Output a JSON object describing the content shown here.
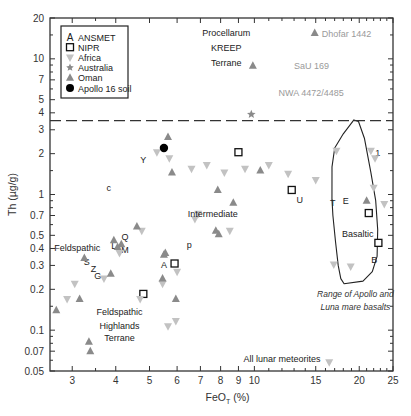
{
  "chart_data": {
    "type": "scatter",
    "title": "",
    "xlabel": "FeO_T (%)",
    "xlabel_main": "FeO",
    "xlabel_sub": "T",
    "xlabel_tail": " (%)",
    "ylabel": "Th (µg/g)",
    "xscale": "log",
    "yscale": "log",
    "xlim": [
      2.59,
      25
    ],
    "ylim": [
      0.05,
      20
    ],
    "x_ticks": [
      3,
      4,
      5,
      6,
      7,
      8,
      9,
      10,
      15,
      20,
      25
    ],
    "x_minor_ticks": [
      3.5,
      11,
      12,
      13,
      14,
      16,
      17,
      18,
      19,
      21,
      22,
      23,
      24
    ],
    "y_ticks": [
      {
        "value": 0.05,
        "label": "0.05"
      },
      {
        "value": 0.07,
        "label": "0.07"
      },
      {
        "value": 0.1,
        "label": "0.1"
      },
      {
        "value": 0.2,
        "label": "0.2"
      },
      {
        "value": 0.3,
        "label": "0.3"
      },
      {
        "value": 0.4,
        "label": "0.4"
      },
      {
        "value": 0.5,
        "label": "0.5"
      },
      {
        "value": 0.7,
        "label": "0.7"
      },
      {
        "value": 1,
        "label": "1"
      },
      {
        "value": 2,
        "label": "2"
      },
      {
        "value": 3,
        "label": "3"
      },
      {
        "value": 4,
        "label": "4"
      },
      {
        "value": 5,
        "label": "5"
      },
      {
        "value": 7,
        "label": "7"
      },
      {
        "value": 10,
        "label": "10"
      },
      {
        "value": 20,
        "label": "20"
      }
    ],
    "y_minor_ticks": [
      0.06,
      0.08,
      0.09,
      0.15,
      0.6,
      0.8,
      0.9,
      1.5,
      6,
      8,
      9,
      15
    ],
    "grid": false,
    "legend_position": "upper left",
    "legend": [
      {
        "symbol": "letter-A",
        "label": "ANSMET"
      },
      {
        "symbol": "open-square",
        "label": "NIPR"
      },
      {
        "symbol": "down-triangle",
        "label": "Africa"
      },
      {
        "symbol": "star",
        "label": "Australia"
      },
      {
        "symbol": "up-triangle",
        "label": "Oman"
      },
      {
        "symbol": "filled-circle",
        "label": "Apollo 16 soil"
      }
    ],
    "reference_line": {
      "style": "dashed",
      "y": 3.5
    },
    "region_labels": [
      {
        "text": "Procellarum",
        "x": 8.3,
        "y": 15.5
      },
      {
        "text": "KREEP",
        "x": 8.3,
        "y": 12.0
      },
      {
        "text": "Terrane",
        "x": 8.3,
        "y": 9.3
      },
      {
        "text": "Intermediate",
        "x": 7.6,
        "y": 0.72
      },
      {
        "text": "Feldspathic",
        "x": 3.1,
        "y": 0.4
      },
      {
        "text": "Feldspathic",
        "x": 4.1,
        "y": 0.135
      },
      {
        "text": "Highlands",
        "x": 4.1,
        "y": 0.108
      },
      {
        "text": "Terrane",
        "x": 4.1,
        "y": 0.087
      },
      {
        "text": "Basaltic",
        "x": 19.8,
        "y": 0.51
      },
      {
        "text": "All lunar meteorites",
        "x": 12.0,
        "y": 0.061
      }
    ],
    "italic_annotation": {
      "lines": [
        "Range of Apollo and",
        "Luna mare basalts"
      ],
      "x": 19.5,
      "y": [
        0.185,
        0.148
      ]
    },
    "named_points": [
      {
        "label": "Dhofar 1442",
        "series": "Oman",
        "x": 14.9,
        "y": 15.5
      },
      {
        "label": "SaU 169",
        "series": "Oman",
        "x": 12.4,
        "y": 8.9
      },
      {
        "label": "NWA 4472/4485",
        "series": "Africa",
        "x": 11.2,
        "y": 5.6
      }
    ],
    "series": [
      {
        "name": "ANSMET",
        "symbol": "letter",
        "points": [
          {
            "x": 5.5,
            "y": 0.305,
            "letter": "A"
          },
          {
            "x": 22.1,
            "y": 0.33,
            "letter": "B"
          },
          {
            "x": 3.82,
            "y": 1.12,
            "letter": "c"
          },
          {
            "x": 18.3,
            "y": 0.91,
            "letter": "E"
          },
          {
            "x": 3.55,
            "y": 0.255,
            "letter": "G"
          },
          {
            "x": 3.95,
            "y": 0.42,
            "letter": "L"
          },
          {
            "x": 4.25,
            "y": 0.395,
            "letter": "M"
          },
          {
            "x": 6.5,
            "y": 0.43,
            "letter": "p"
          },
          {
            "x": 4.25,
            "y": 0.49,
            "letter": "Q"
          },
          {
            "x": 3.3,
            "y": 0.32,
            "letter": "S"
          },
          {
            "x": 16.8,
            "y": 0.88,
            "letter": "T"
          },
          {
            "x": 13.5,
            "y": 0.92,
            "letter": "U"
          },
          {
            "x": 4.8,
            "y": 1.82,
            "letter": "Y"
          },
          {
            "x": 3.45,
            "y": 0.285,
            "letter": "Z"
          },
          {
            "x": 22.6,
            "y": 2.05,
            "letter": "1"
          }
        ]
      },
      {
        "name": "NIPR",
        "symbol": "open-square",
        "points": [
          {
            "x": 5.9,
            "y": 0.31
          },
          {
            "x": 4.8,
            "y": 0.185
          },
          {
            "x": 9.0,
            "y": 2.05
          },
          {
            "x": 12.8,
            "y": 1.08
          },
          {
            "x": 21.3,
            "y": 0.73
          },
          {
            "x": 22.7,
            "y": 0.44
          }
        ]
      },
      {
        "name": "Africa",
        "symbol": "down-triangle",
        "points": [
          {
            "x": 5.25,
            "y": 2.05
          },
          {
            "x": 5.7,
            "y": 1.85
          },
          {
            "x": 6.6,
            "y": 1.55
          },
          {
            "x": 7.3,
            "y": 1.65
          },
          {
            "x": 8.2,
            "y": 1.45
          },
          {
            "x": 9.4,
            "y": 1.55
          },
          {
            "x": 11.0,
            "y": 1.65
          },
          {
            "x": 12.5,
            "y": 1.42
          },
          {
            "x": 15.0,
            "y": 1.28
          },
          {
            "x": 17.2,
            "y": 2.1
          },
          {
            "x": 21.6,
            "y": 2.1
          },
          {
            "x": 22.2,
            "y": 1.85
          },
          {
            "x": 22.0,
            "y": 1.12
          },
          {
            "x": 23.6,
            "y": 0.85
          },
          {
            "x": 8.5,
            "y": 0.54
          },
          {
            "x": 6.9,
            "y": 0.72
          },
          {
            "x": 6.75,
            "y": 0.66
          },
          {
            "x": 4.75,
            "y": 0.54
          },
          {
            "x": 4.1,
            "y": 0.37
          },
          {
            "x": 5.45,
            "y": 0.22
          },
          {
            "x": 4.7,
            "y": 0.17
          },
          {
            "x": 3.7,
            "y": 0.24
          },
          {
            "x": 3.05,
            "y": 0.22
          },
          {
            "x": 2.9,
            "y": 0.17
          },
          {
            "x": 5.65,
            "y": 0.107
          },
          {
            "x": 5.95,
            "y": 0.117
          },
          {
            "x": 16.4,
            "y": 0.058
          },
          {
            "x": 16.9,
            "y": 0.305
          },
          {
            "x": 18.9,
            "y": 0.295
          },
          {
            "x": 6.0,
            "y": 0.27
          }
        ]
      },
      {
        "name": "Australia",
        "symbol": "star",
        "points": [
          {
            "x": 9.8,
            "y": 3.9
          }
        ]
      },
      {
        "name": "Oman",
        "symbol": "up-triangle",
        "points": [
          {
            "x": 5.65,
            "y": 2.65
          },
          {
            "x": 5.8,
            "y": 1.45
          },
          {
            "x": 7.85,
            "y": 1.08
          },
          {
            "x": 8.7,
            "y": 0.87
          },
          {
            "x": 10.4,
            "y": 1.5
          },
          {
            "x": 7.75,
            "y": 0.54
          },
          {
            "x": 7.9,
            "y": 0.51
          },
          {
            "x": 4.6,
            "y": 0.58
          },
          {
            "x": 3.95,
            "y": 0.46
          },
          {
            "x": 4.15,
            "y": 0.43
          },
          {
            "x": 4.05,
            "y": 0.41
          },
          {
            "x": 5.5,
            "y": 0.36
          },
          {
            "x": 5.55,
            "y": 0.37
          },
          {
            "x": 5.45,
            "y": 0.24
          },
          {
            "x": 3.87,
            "y": 0.26
          },
          {
            "x": 3.25,
            "y": 0.34
          },
          {
            "x": 3.15,
            "y": 0.17
          },
          {
            "x": 2.7,
            "y": 0.14
          },
          {
            "x": 3.35,
            "y": 0.082
          },
          {
            "x": 3.38,
            "y": 0.07
          },
          {
            "x": 5.95,
            "y": 0.17
          },
          {
            "x": 9.9,
            "y": 8.9
          },
          {
            "x": 14.9,
            "y": 15.5
          },
          {
            "x": 21.0,
            "y": 0.9
          }
        ]
      },
      {
        "name": "Apollo 16 soil",
        "symbol": "filled-circle",
        "points": [
          {
            "x": 5.5,
            "y": 2.2
          }
        ]
      }
    ],
    "mare_basalt_envelope": [
      [
        16.7,
        0.92
      ],
      [
        16.7,
        1.6
      ],
      [
        17.0,
        2.2
      ],
      [
        18.0,
        2.8
      ],
      [
        19.3,
        3.55
      ],
      [
        19.9,
        3.45
      ],
      [
        20.7,
        2.6
      ],
      [
        21.6,
        1.45
      ],
      [
        22.3,
        0.9
      ],
      [
        22.6,
        0.55
      ],
      [
        22.5,
        0.35
      ],
      [
        21.8,
        0.27
      ],
      [
        20.5,
        0.23
      ],
      [
        18.1,
        0.22
      ],
      [
        17.7,
        0.24
      ],
      [
        17.4,
        0.3
      ],
      [
        17.1,
        0.45
      ],
      [
        16.8,
        0.7
      ],
      [
        16.7,
        0.92
      ]
    ]
  },
  "colors": {
    "axis": "#333333",
    "text": "#222222",
    "oman": "#8a8a8a",
    "africa": "#c2c2c2",
    "named_text": "#9a9a9a",
    "circle": "#000000"
  }
}
